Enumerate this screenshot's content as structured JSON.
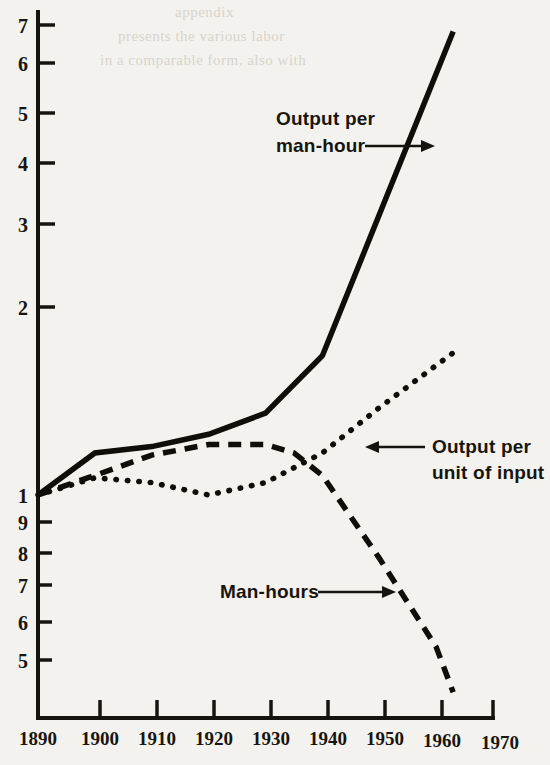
{
  "chart_data": {
    "type": "line",
    "title": "",
    "xlabel": "",
    "ylabel": "",
    "y_scale": "log",
    "ylim": [
      0.45,
      7.4
    ],
    "xlim": [
      1890,
      1970
    ],
    "grid": false,
    "legend": "annotations-inline",
    "x_tick_labels": [
      "1890",
      "1900",
      "1910",
      "1920",
      "1930",
      "1940",
      "1950",
      "1960",
      "1970"
    ],
    "x_ticks": [
      1890,
      1900,
      1910,
      1920,
      1930,
      1940,
      1950,
      1960,
      1970
    ],
    "y_tick_labels": [
      "7",
      "6",
      "5",
      "4",
      "3",
      "2",
      "1",
      "9",
      "8",
      "7",
      "6",
      "5"
    ],
    "y_ticks": [
      7,
      6,
      5,
      4,
      3,
      2,
      1,
      0.9,
      0.8,
      0.7,
      0.6,
      0.5
    ],
    "series": [
      {
        "name": "Output per man-hour",
        "style": "solid",
        "x": [
          1890,
          1900,
          1910,
          1920,
          1930,
          1940,
          1963
        ],
        "values": [
          1.0,
          1.18,
          1.21,
          1.27,
          1.38,
          1.73,
          6.2
        ]
      },
      {
        "name": "Man-hours",
        "style": "dashed",
        "x": [
          1890,
          1900,
          1910,
          1920,
          1930,
          1935,
          1940,
          1950,
          1960,
          1963
        ],
        "values": [
          1.0,
          1.08,
          1.17,
          1.22,
          1.22,
          1.18,
          1.08,
          0.78,
          0.55,
          0.46
        ]
      },
      {
        "name": "Output per unit of input",
        "style": "dotted",
        "x": [
          1890,
          1900,
          1910,
          1920,
          1930,
          1940,
          1950,
          1963
        ],
        "values": [
          1.0,
          1.07,
          1.05,
          1.0,
          1.05,
          1.18,
          1.41,
          1.75
        ]
      }
    ],
    "annotations": [
      {
        "text_line1": "Output per",
        "text_line2": "man-hour",
        "arrow": "right",
        "target_series": "Output per man-hour"
      },
      {
        "text_line1": "Output per",
        "text_line2": "unit of input",
        "arrow": "left",
        "target_series": "Output per unit of input"
      },
      {
        "text_line1": "Man-hours",
        "text_line2": "",
        "arrow": "right",
        "target_series": "Man-hours"
      }
    ],
    "colors": {
      "ink": "#16140e",
      "background": "#f4f2ee"
    }
  },
  "bleed_through_text": {
    "line1": "appendix",
    "line2": "presents the various labor",
    "line3": "in a comparable form, also with"
  }
}
